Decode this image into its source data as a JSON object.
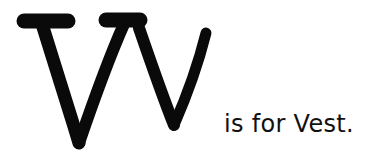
{
  "illustration": {
    "letters": "Vv",
    "uppercase": "V",
    "lowercase": "v",
    "ink_color": "#0a0a0a",
    "background_color": "#ffffff"
  },
  "caption": {
    "text": "is for Vest."
  }
}
